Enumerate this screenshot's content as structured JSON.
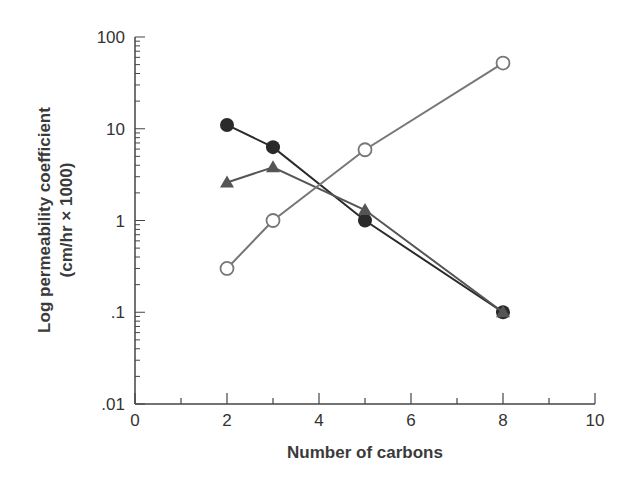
{
  "chart_data": {
    "type": "line",
    "title": "",
    "xlabel": "Number of carbons",
    "ylabel": "Log permeability coefficient",
    "ylabel_line2": "(cm/hr × 1000)",
    "xlim": [
      0,
      10
    ],
    "ylim": [
      0.01,
      100
    ],
    "yscale": "log",
    "grid": false,
    "legend": null,
    "x_ticks": [
      "0",
      "2",
      "4",
      "6",
      "8",
      "10"
    ],
    "y_ticks": [
      "100",
      "10",
      "1",
      ".1",
      ".01"
    ],
    "series": [
      {
        "name": "filled-circles",
        "marker": "filled-circle",
        "color": "#2a2a2a",
        "x": [
          2,
          3,
          5,
          8
        ],
        "values": [
          11,
          6.3,
          1.0,
          0.1
        ]
      },
      {
        "name": "filled-triangles",
        "marker": "filled-triangle",
        "color": "#555555",
        "x": [
          2,
          3,
          5,
          8
        ],
        "values": [
          2.6,
          3.8,
          1.3,
          0.1
        ]
      },
      {
        "name": "open-circles",
        "marker": "open-circle",
        "color": "#777777",
        "x": [
          2,
          3,
          5,
          8
        ],
        "values": [
          0.3,
          1.0,
          5.9,
          52
        ]
      }
    ]
  }
}
